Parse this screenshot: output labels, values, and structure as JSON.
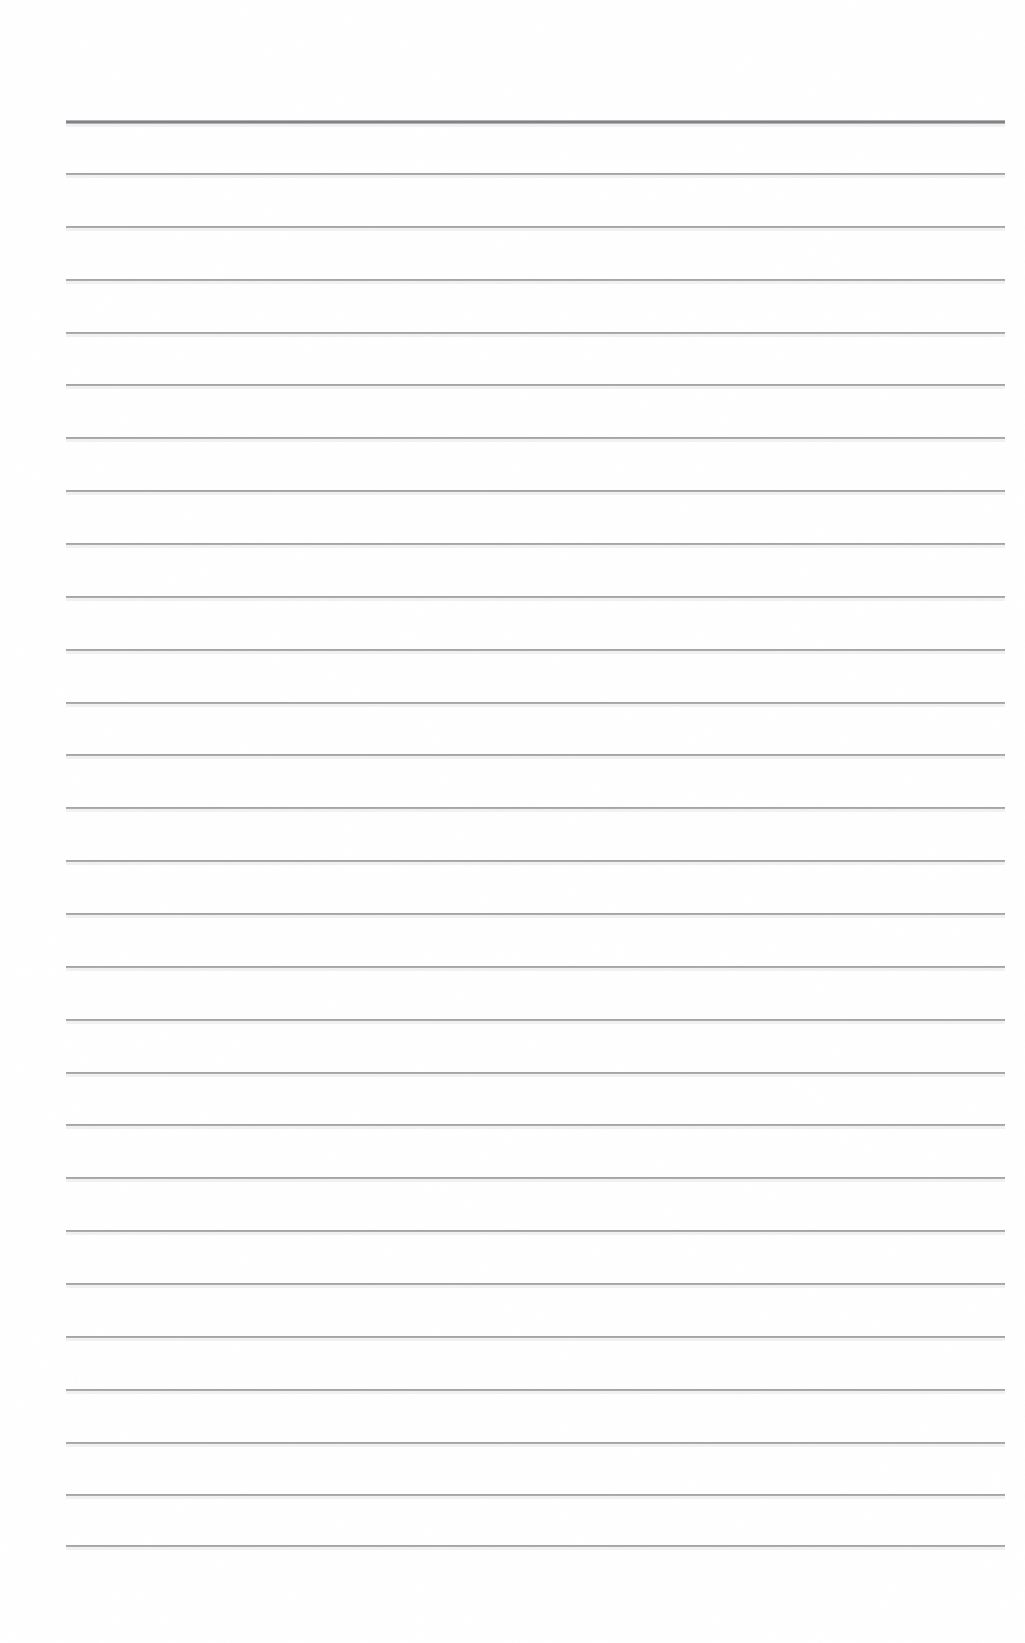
{
  "document": {
    "kind": "scanned-blank-ruled-page",
    "description": "Scanned blank lined notebook page",
    "background_color": "#ffffff",
    "page_width": 1025,
    "page_height": 1643
  },
  "ruling": {
    "line_color": "#8f8f95",
    "header_line_color": "#76767b",
    "left_margin_x": 66,
    "right_margin_x": 1005,
    "line_length": 939,
    "line_spacing": 52.8,
    "first_line_y": 120,
    "last_line_y": 1545,
    "line_count": 28,
    "header_line_thickness": 4,
    "body_line_thickness": 2,
    "lines": [
      {
        "index": 1,
        "y": 120,
        "type": "header"
      },
      {
        "index": 2,
        "y": 173,
        "type": "body"
      },
      {
        "index": 3,
        "y": 226,
        "type": "body"
      },
      {
        "index": 4,
        "y": 279,
        "type": "body"
      },
      {
        "index": 5,
        "y": 332,
        "type": "body"
      },
      {
        "index": 6,
        "y": 384,
        "type": "body"
      },
      {
        "index": 7,
        "y": 437,
        "type": "body"
      },
      {
        "index": 8,
        "y": 490,
        "type": "body"
      },
      {
        "index": 9,
        "y": 543,
        "type": "body"
      },
      {
        "index": 10,
        "y": 596,
        "type": "body"
      },
      {
        "index": 11,
        "y": 649,
        "type": "body"
      },
      {
        "index": 12,
        "y": 702,
        "type": "body"
      },
      {
        "index": 13,
        "y": 754,
        "type": "body"
      },
      {
        "index": 14,
        "y": 807,
        "type": "body"
      },
      {
        "index": 15,
        "y": 860,
        "type": "body"
      },
      {
        "index": 16,
        "y": 913,
        "type": "body"
      },
      {
        "index": 17,
        "y": 966,
        "type": "body"
      },
      {
        "index": 18,
        "y": 1019,
        "type": "body"
      },
      {
        "index": 19,
        "y": 1072,
        "type": "body"
      },
      {
        "index": 20,
        "y": 1124,
        "type": "body"
      },
      {
        "index": 21,
        "y": 1177,
        "type": "body"
      },
      {
        "index": 22,
        "y": 1230,
        "type": "body"
      },
      {
        "index": 23,
        "y": 1283,
        "type": "body"
      },
      {
        "index": 24,
        "y": 1336,
        "type": "body"
      },
      {
        "index": 25,
        "y": 1389,
        "type": "body"
      },
      {
        "index": 26,
        "y": 1442,
        "type": "body"
      },
      {
        "index": 27,
        "y": 1494,
        "type": "body"
      },
      {
        "index": 28,
        "y": 1545,
        "type": "body"
      }
    ]
  },
  "content": {
    "text": "",
    "note": "The page contains no handwritten or printed text — only the preprinted ruling."
  }
}
